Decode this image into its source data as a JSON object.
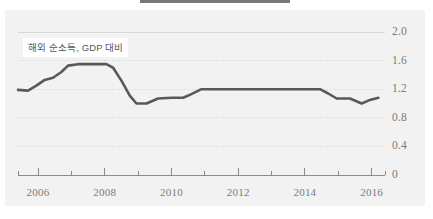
{
  "figure": {
    "banner_color": "#77787a",
    "panel_color": "#f2f2f2",
    "line_color": "#595959",
    "grid_color": "#d8d8d8",
    "tick_color": "#8a8a8a",
    "label_color": "#7b7b7b"
  },
  "chart_data": {
    "type": "line",
    "title": "",
    "xlabel": "",
    "ylabel": "",
    "legend": [
      "해외 순소득, GDP 대비"
    ],
    "legend_position": "inside-top-left",
    "grid": true,
    "xlim": [
      2005.4,
      2016.4
    ],
    "ylim": [
      0,
      2.0
    ],
    "yticks": [
      0,
      0.4,
      0.8,
      1.2,
      1.6,
      2.0
    ],
    "ytick_labels": [
      "0",
      "0.4",
      "0.8",
      "1.2",
      "1.6",
      "2.0"
    ],
    "xticks": [
      2006,
      2008,
      2010,
      2012,
      2014,
      2016
    ],
    "xtick_labels": [
      "2006",
      "2008",
      "2010",
      "2012",
      "2014",
      "2016"
    ],
    "xminor_ticks": [
      2005.4,
      2007,
      2009,
      2011,
      2013,
      2015,
      2016.4
    ],
    "series": [
      {
        "name": "해외 순소득, GDP 대비",
        "color": "#595959",
        "x": [
          2005.4,
          2005.7,
          2005.95,
          2006.2,
          2006.45,
          2006.7,
          2006.9,
          2007.2,
          2007.6,
          2008.05,
          2008.25,
          2008.5,
          2008.75,
          2008.95,
          2009.25,
          2009.6,
          2010.0,
          2010.35,
          2010.55,
          2010.9,
          2011.5,
          2012.0,
          2012.5,
          2013.0,
          2013.5,
          2014.0,
          2014.45,
          2014.7,
          2014.95,
          2015.35,
          2015.7,
          2015.95,
          2016.2
        ],
        "y": [
          1.19,
          1.18,
          1.25,
          1.33,
          1.36,
          1.44,
          1.53,
          1.55,
          1.55,
          1.55,
          1.5,
          1.32,
          1.11,
          1.0,
          1.0,
          1.07,
          1.08,
          1.08,
          1.12,
          1.2,
          1.2,
          1.2,
          1.2,
          1.2,
          1.2,
          1.2,
          1.2,
          1.14,
          1.07,
          1.07,
          1.0,
          1.05,
          1.08
        ]
      }
    ]
  }
}
